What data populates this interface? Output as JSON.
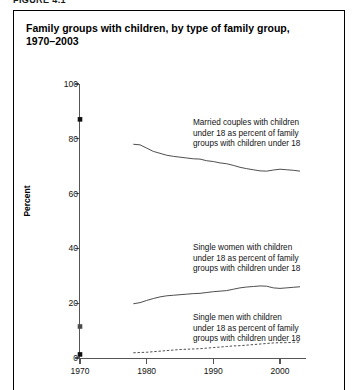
{
  "figure_label": "FIGURE 4.1",
  "title": "Family groups with children, by type of family group,\n1970–2003",
  "annotations": {
    "married": "Married couples with children\nunder 18 as percent of family\ngroups with children under 18",
    "women": "Single women with children\nunder 18 as percent of family\ngroups with children under 18",
    "men": "Single men with children\nunder 18 as percent of family\ngroups with children under 18"
  },
  "colors": {
    "line": "#3a3a3a",
    "axis": "#555555",
    "text": "#111111",
    "frame": "#000000"
  },
  "chart_data": {
    "type": "line",
    "title": "Family groups with children, by type of family group, 1970–2003",
    "xlabel": "",
    "ylabel": "Percent",
    "xlim": [
      1968,
      2004
    ],
    "ylim": [
      0,
      100
    ],
    "xticks": [
      1970,
      1980,
      1990,
      2000
    ],
    "xtick_labels": [
      "1970",
      "1980",
      "1990",
      "2000"
    ],
    "yticks": [
      0,
      20,
      40,
      60,
      80,
      100
    ],
    "ytick_labels": [
      "0",
      "20",
      "40",
      "60",
      "80",
      "100"
    ],
    "grid": false,
    "legend": "annotations-inline",
    "markers_1970": [
      {
        "series": "Married couples with children under 18",
        "x": 1970,
        "y": 87.1
      },
      {
        "series": "Single women with children under 18",
        "x": 1970,
        "y": 11.5
      },
      {
        "series": "Single men with children under 18",
        "x": 1970,
        "y": 1.3
      }
    ],
    "series": [
      {
        "name": "Married couples with children under 18 as percent of family groups with children under 18",
        "style": "solid",
        "x": [
          1978,
          1979,
          1980,
          1981,
          1982,
          1983,
          1984,
          1985,
          1986,
          1987,
          1988,
          1989,
          1990,
          1991,
          1992,
          1993,
          1994,
          1995,
          1996,
          1997,
          1998,
          1999,
          2000,
          2001,
          2002,
          2003
        ],
        "y": [
          78.0,
          77.8,
          76.6,
          75.4,
          74.7,
          74.0,
          73.6,
          73.3,
          73.0,
          72.7,
          72.6,
          72.0,
          71.7,
          71.2,
          70.9,
          70.3,
          69.6,
          69.1,
          68.7,
          68.3,
          68.2,
          68.6,
          68.9,
          68.7,
          68.5,
          68.2
        ]
      },
      {
        "name": "Single women with children under 18 as percent of family groups with children under 18",
        "style": "solid",
        "x": [
          1978,
          1979,
          1980,
          1981,
          1982,
          1983,
          1984,
          1985,
          1986,
          1987,
          1988,
          1989,
          1990,
          1991,
          1992,
          1993,
          1994,
          1995,
          1996,
          1997,
          1998,
          1999,
          2000,
          2001,
          2002,
          2003
        ],
        "y": [
          19.8,
          20.2,
          21.0,
          21.7,
          22.3,
          22.7,
          22.9,
          23.1,
          23.3,
          23.5,
          23.6,
          23.9,
          24.2,
          24.4,
          24.6,
          25.1,
          25.6,
          25.9,
          26.1,
          26.3,
          26.2,
          25.6,
          25.4,
          25.6,
          25.8,
          26.0
        ]
      },
      {
        "name": "Single men with children under 18 as percent of family groups with children under 18",
        "style": "dashed",
        "x": [
          1978,
          1979,
          1980,
          1981,
          1982,
          1983,
          1984,
          1985,
          1986,
          1987,
          1988,
          1989,
          1990,
          1991,
          1992,
          1993,
          1994,
          1995,
          1996,
          1997,
          1998,
          1999,
          2000,
          2001,
          2002,
          2003
        ],
        "y": [
          1.9,
          2.0,
          2.1,
          2.3,
          2.5,
          2.7,
          2.9,
          3.1,
          3.2,
          3.3,
          3.4,
          3.6,
          3.8,
          4.0,
          4.2,
          4.4,
          4.5,
          4.7,
          4.9,
          5.1,
          5.3,
          5.5,
          5.6,
          5.6,
          5.7,
          5.8
        ]
      }
    ]
  }
}
